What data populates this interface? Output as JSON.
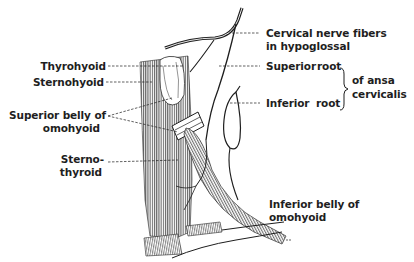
{
  "diagram": {
    "style": "black line illustration on white",
    "colors": {
      "ink": "#1e1e1e",
      "background": "#ffffff"
    },
    "labels": {
      "thyrohyoid": "Thyrohyoid",
      "sternohyoid": "Sternohyoid",
      "superior_belly_line1": "Superior belly of",
      "superior_belly_line2": "omohyoid",
      "sternothyroid_line1": "Sterno-",
      "sternothyroid_line2": "thyroid",
      "cervical_nerve_line1": "Cervical nerve fibers",
      "cervical_nerve_line2": "in hypoglossal",
      "superior_root": "Superior",
      "superior_root_word": "root",
      "inferior_root": "Inferior",
      "inferior_root_word": "root",
      "ansa_line1": "of ansa",
      "ansa_line2": "cervicalis",
      "inferior_belly_line1": "Inferior belly of",
      "inferior_belly_line2": "omohyoid"
    }
  }
}
